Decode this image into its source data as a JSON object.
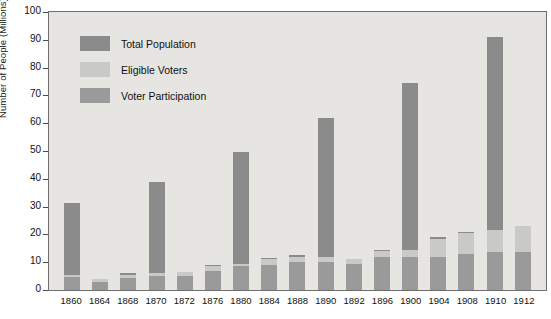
{
  "chart_data": {
    "type": "bar",
    "subtype": "stacked-bar",
    "title": "",
    "xlabel": "",
    "ylabel": "Number of People (Millions)",
    "ylim": [
      0,
      100
    ],
    "ytick_step": 10,
    "yticks": [
      "100",
      "90",
      "80",
      "70",
      "60",
      "50",
      "40",
      "30",
      "20",
      "10",
      "0"
    ],
    "grid": false,
    "legend_position": "upper-left-inside",
    "categories": [
      "1860",
      "1864",
      "1868",
      "1870",
      "1872",
      "1876",
      "1880",
      "1884",
      "1888",
      "1890",
      "1892",
      "1896",
      "1900",
      "1904",
      "1908",
      "1910",
      "1912"
    ],
    "series": [
      {
        "name": "Total Population",
        "color": "#8b8b8b",
        "values": [
          31.4,
          4.0,
          6.0,
          39.0,
          6.5,
          9.0,
          49.5,
          11.5,
          12.5,
          62.0,
          11.0,
          14.5,
          74.5,
          19.0,
          21.0,
          91.0,
          23.0
        ]
      },
      {
        "name": "Eligible Voters",
        "color": "#c9c9c6",
        "values": [
          5.5,
          4.0,
          5.5,
          6.0,
          6.5,
          8.5,
          9.5,
          11.0,
          12.0,
          12.0,
          11.0,
          14.0,
          14.5,
          18.5,
          20.5,
          21.5,
          23.0
        ]
      },
      {
        "name": "Voter Participation",
        "color": "#9a9a9a",
        "values": [
          4.7,
          3.0,
          4.5,
          5.0,
          5.0,
          7.0,
          8.5,
          9.0,
          10.0,
          10.0,
          9.5,
          12.0,
          12.0,
          12.0,
          13.0,
          13.5,
          13.5
        ]
      }
    ]
  },
  "legend": {
    "items": [
      {
        "label": "Total Population",
        "color": "#8b8b8b"
      },
      {
        "label": "Eligible Voters",
        "color": "#c9c9c6"
      },
      {
        "label": "Voter Participation",
        "color": "#9a9a9a"
      }
    ]
  },
  "axes": {
    "y_title": "Number of People (Millions)"
  }
}
